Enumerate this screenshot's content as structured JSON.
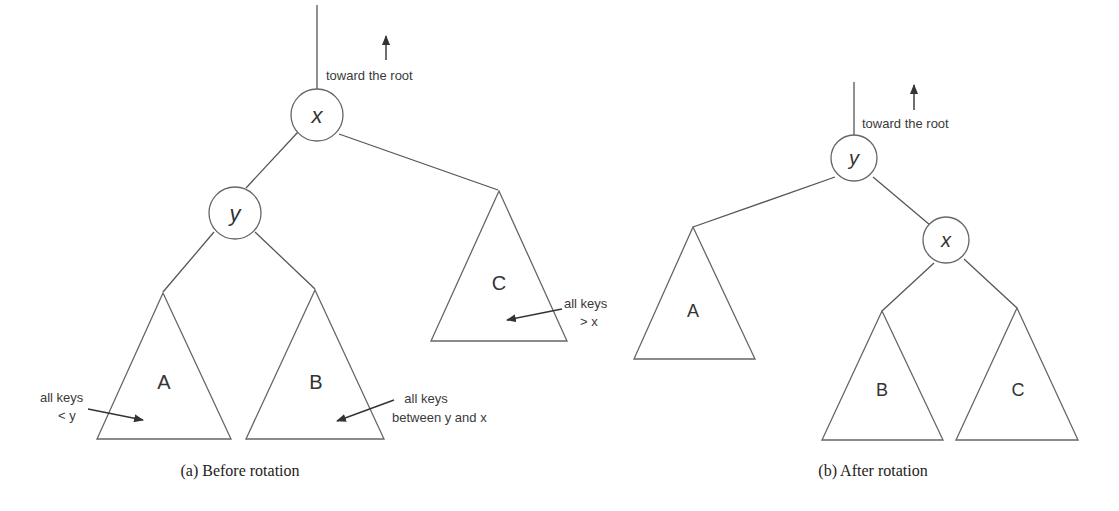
{
  "figure": {
    "colors": {
      "stroke": "#666666",
      "text": "#333333",
      "background": "#ffffff"
    },
    "before": {
      "caption": "(a)  Before rotation",
      "root_note": "toward the root",
      "nodes": {
        "top": "x",
        "child": "y"
      },
      "subtrees": {
        "left": "A",
        "middle": "B",
        "right": "C"
      },
      "notes": {
        "a_line1": "all keys",
        "a_line2": "< y",
        "b_line1": "all keys",
        "b_line2": "between y and x",
        "c_line1": "all keys",
        "c_line2": "> x"
      }
    },
    "after": {
      "caption": "(b)  After rotation",
      "root_note": "toward the root",
      "nodes": {
        "top": "y",
        "child": "x"
      },
      "subtrees": {
        "left": "A",
        "middle": "B",
        "right": "C"
      }
    }
  }
}
